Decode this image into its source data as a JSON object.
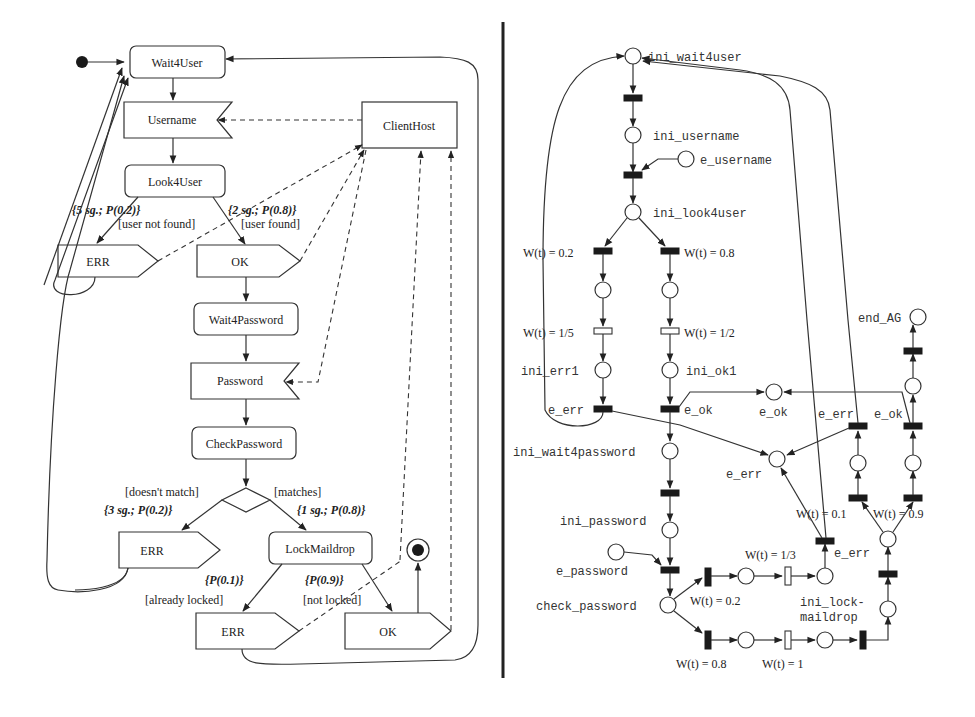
{
  "uml": {
    "states": {
      "wait4user": "Wait4User",
      "username": "Username",
      "look4user": "Look4User",
      "clienthost": "ClientHost",
      "err1": "ERR",
      "ok1": "OK",
      "wait4password": "Wait4Password",
      "password": "Password",
      "checkpassword": "CheckPassword",
      "err2": "ERR",
      "lockmaildrop": "LockMaildrop",
      "err3": "ERR",
      "ok2": "OK"
    },
    "guards": {
      "user_not_found": "[user not found]",
      "user_found": "[user found]",
      "doesnt_match": "[doesn't match]",
      "matches": "[matches]",
      "already_locked": "[already locked]",
      "not_locked": "[not locked]"
    },
    "annotations": {
      "p_not_found": "{5 sg.; P(0.2)}",
      "p_found": "{2 sg.; P(0.8)}",
      "p_nomatch": "{3 sg.; P(0.2)}",
      "p_match": "{1 sg.; P(0.8)}",
      "p_locked": "{P(0.1)}",
      "p_notlocked": "{P(0.9)}"
    }
  },
  "petri": {
    "places": {
      "ini_wait4user": "ini_wait4user",
      "ini_username": "ini_username",
      "e_username": "e_username",
      "ini_look4user": "ini_look4user",
      "ini_err1": "ini_err1",
      "ini_ok1": "ini_ok1",
      "e_ok_place": "e_ok",
      "end_ag": "end_AG",
      "ini_wait4password": "ini_wait4password",
      "e_err_place": "e_err",
      "ini_password": "ini_password",
      "e_password": "e_password",
      "check_password": "check_password",
      "ini_lock_maildrop_1": "ini_lock-",
      "ini_lock_maildrop_2": "maildrop"
    },
    "transitions": {
      "e_err_1": "e_err",
      "e_ok_1": "e_ok",
      "e_err_2": "e_err",
      "e_ok_2": "e_ok",
      "e_err_3": "e_err"
    },
    "weights": {
      "w_02_a": "W(t) = 0.2",
      "w_08_a": "W(t) = 0.8",
      "w_15": "W(t) = 1/5",
      "w_12": "W(t) = 1/2",
      "w_01": "W(t) = 0.1",
      "w_09": "W(t) = 0.9",
      "w_13": "W(t) = 1/3",
      "w_02_b": "W(t) = 0.2",
      "w_08_b": "W(t) = 0.8",
      "w_1": "W(t) = 1"
    }
  }
}
